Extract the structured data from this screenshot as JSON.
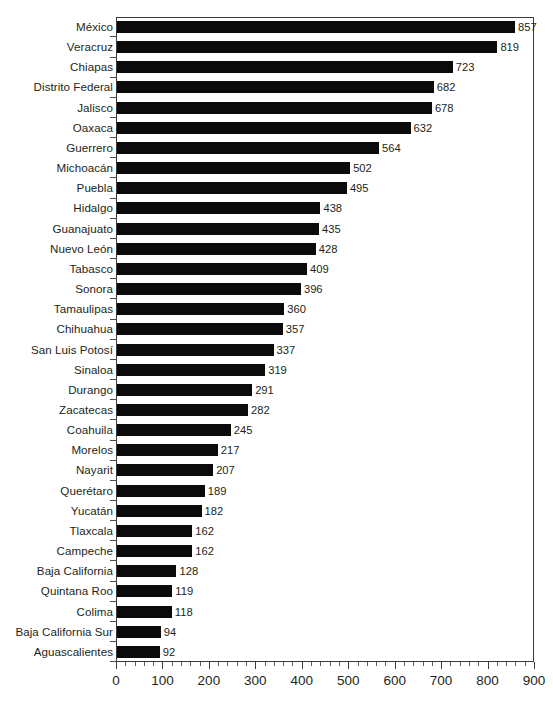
{
  "chart_data": {
    "type": "bar",
    "orientation": "horizontal",
    "title": "",
    "subtitle": "",
    "xlabel": "",
    "ylabel": "",
    "xlim": [
      0,
      900
    ],
    "xticks": [
      0,
      100,
      200,
      300,
      400,
      500,
      600,
      700,
      800,
      900
    ],
    "minor_tick_step": 20,
    "grid": false,
    "legend": null,
    "bar_color": "#0b0b0b",
    "background_color": "#ffffff",
    "axis_color": "#3a3a3a",
    "data_labels": true,
    "categories": [
      "México",
      "Veracruz",
      "Chiapas",
      "Distrito Federal",
      "Jalisco",
      "Oaxaca",
      "Guerrero",
      "Michoacán",
      "Puebla",
      "Hidalgo",
      "Guanajuato",
      "Nuevo León",
      "Tabasco",
      "Sonora",
      "Tamaulipas",
      "Chihuahua",
      "San Luis Potosí",
      "Sinaloa",
      "Durango",
      "Zacatecas",
      "Coahuila",
      "Morelos",
      "Nayarit",
      "Querétaro",
      "Yucatán",
      "Tlaxcala",
      "Campeche",
      "Baja California",
      "Quintana Roo",
      "Colima",
      "Baja California Sur",
      "Aguascalientes"
    ],
    "values": [
      857,
      819,
      723,
      682,
      678,
      632,
      564,
      502,
      495,
      438,
      435,
      428,
      409,
      396,
      360,
      357,
      337,
      319,
      291,
      282,
      245,
      217,
      207,
      189,
      182,
      162,
      162,
      128,
      119,
      118,
      94,
      92
    ]
  }
}
